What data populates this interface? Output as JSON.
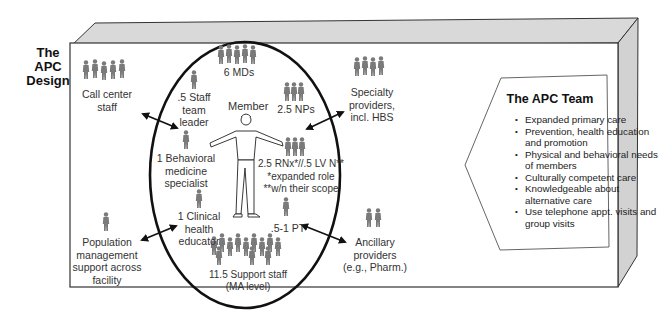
{
  "diagram": {
    "title": "The APC Design",
    "title_lines": [
      "The",
      "APC",
      "Design"
    ],
    "colors": {
      "box_face": "#ffffff",
      "box_side": "#d8d8d8",
      "outline": "#333333",
      "figure": "#7a7a7a",
      "text": "#333333"
    },
    "center": {
      "label": "Member",
      "shape": "ellipse"
    },
    "inner_roles": [
      {
        "id": "mds",
        "label": "6 MDs",
        "figures": 5
      },
      {
        "id": "staff-team-leader",
        "label_lines": [
          ".5 Staff",
          "team",
          "leader"
        ],
        "figures": 1
      },
      {
        "id": "nps",
        "label": "2.5 NPs",
        "figures": 3
      },
      {
        "id": "behavioral",
        "label_lines": [
          "1 Behavioral",
          "medicine",
          "specialist"
        ],
        "figures": 1
      },
      {
        "id": "rns",
        "label_lines": [
          "2.5 RNx*//.5 LV N**",
          "*expanded role",
          "**w/n their scope"
        ],
        "figures": 3
      },
      {
        "id": "clinical-educator",
        "label_lines": [
          "1 Clinical",
          "health",
          "educator"
        ],
        "figures": 1
      },
      {
        "id": "pt",
        "label": ".5-1 PT",
        "figures": 1
      },
      {
        "id": "support-staff",
        "label_lines": [
          "11.5 Support staff",
          "(MA level)"
        ],
        "figures": 12
      }
    ],
    "outer_roles": [
      {
        "id": "call-center",
        "label_lines": [
          "Call center",
          "staff"
        ],
        "figures": 5
      },
      {
        "id": "specialty",
        "label_lines": [
          "Specialty",
          "providers,",
          "incl. HBS"
        ],
        "figures": 4
      },
      {
        "id": "population",
        "label_lines": [
          "Population",
          "management",
          "support across",
          "facility"
        ],
        "figures": 1
      },
      {
        "id": "ancillary",
        "label_lines": [
          "Ancillary",
          "providers",
          "(e.g., Pharm.)"
        ],
        "figures": 2
      }
    ],
    "team_box": {
      "title": "The APC Team",
      "items": [
        "Expanded primary care",
        "Prevention, health education and promotion",
        "Physical and behavioral needs of members",
        "Culturally competent care",
        "Knowledgeable about alternative care",
        "Use telephone appt. visits and group visits"
      ]
    }
  }
}
